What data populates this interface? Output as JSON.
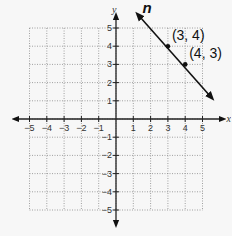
{
  "chart_data": {
    "type": "line",
    "title": "",
    "xlabel": "x",
    "ylabel": "y",
    "xlim": [
      -5,
      5
    ],
    "ylim": [
      -5,
      5
    ],
    "grid": true,
    "x_ticks": [
      -5,
      -4,
      -3,
      -2,
      -1,
      1,
      2,
      3,
      4,
      5
    ],
    "y_ticks": [
      -5,
      -4,
      -3,
      -2,
      -1,
      1,
      2,
      3,
      4,
      5
    ],
    "series": [
      {
        "name": "n",
        "equation": "y = -x + 7",
        "points": [
          {
            "x": 3,
            "y": 4,
            "label": "(3, 4)"
          },
          {
            "x": 4,
            "y": 3,
            "label": "(4, 3)"
          }
        ],
        "extent": {
          "x_start": 1.3,
          "y_start": 5.7,
          "x_end": 5.5,
          "y_end": 1.2
        }
      }
    ],
    "labels": {
      "line_name": "n",
      "x_axis": "x",
      "y_axis": "y",
      "x_tick_labels": [
        "−5",
        "−4",
        "−3",
        "−2",
        "−1",
        "1",
        "2",
        "3",
        "4",
        "5"
      ],
      "y_tick_labels": [
        "5",
        "4",
        "3",
        "2",
        "1",
        "−1",
        "−2",
        "−3",
        "−4",
        "−5"
      ],
      "point_labels": [
        "(3, 4)",
        "(4, 3)"
      ]
    }
  }
}
